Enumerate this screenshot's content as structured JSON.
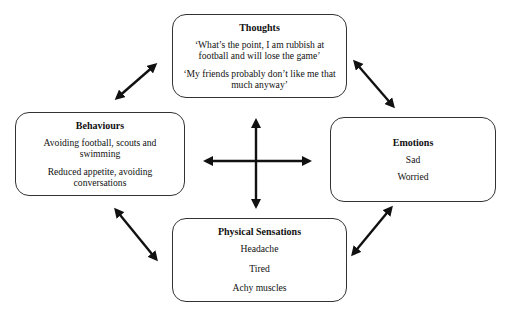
{
  "diagram": {
    "type": "cbt-cycle",
    "nodes": {
      "thoughts": {
        "title": "Thoughts",
        "items": [
          "‘What’s the point, I am rubbish at football and will lose the game’",
          "‘My friends probably don’t like me that much anyway’"
        ]
      },
      "behaviours": {
        "title": "Behaviours",
        "items": [
          "Avoiding football, scouts and swimming",
          "Reduced appetite, avoiding conversations"
        ]
      },
      "emotions": {
        "title": "Emotions",
        "items": [
          "Sad",
          "Worried"
        ]
      },
      "physical": {
        "title": "Physical Sensations",
        "items": [
          "Headache",
          "Tired",
          "Achy muscles"
        ]
      }
    },
    "edges": [
      {
        "from": "behaviours",
        "to": "thoughts",
        "direction": "bidirectional"
      },
      {
        "from": "thoughts",
        "to": "emotions",
        "direction": "bidirectional"
      },
      {
        "from": "behaviours",
        "to": "physical",
        "direction": "bidirectional"
      },
      {
        "from": "physical",
        "to": "emotions",
        "direction": "bidirectional"
      },
      {
        "from": "behaviours",
        "to": "emotions",
        "direction": "bidirectional"
      },
      {
        "from": "thoughts",
        "to": "physical",
        "direction": "bidirectional"
      }
    ],
    "colors": {
      "stroke": "#111111",
      "border": "#333333",
      "background": "#ffffff"
    }
  }
}
